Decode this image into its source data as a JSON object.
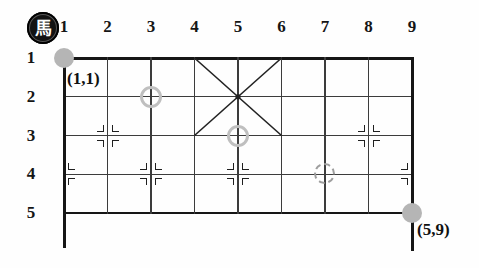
{
  "seal": {
    "char": "馬"
  },
  "board": {
    "columns": [
      "1",
      "2",
      "3",
      "4",
      "5",
      "6",
      "7",
      "8",
      "9"
    ],
    "rows": [
      "1",
      "2",
      "3",
      "4",
      "5"
    ],
    "start_label": "(1,1)",
    "end_label": "(5,9)",
    "markers": [
      {
        "type": "filled-circle",
        "row": 1,
        "col": 1
      },
      {
        "type": "ring-circle",
        "row": 2,
        "col": 3
      },
      {
        "type": "ring-circle",
        "row": 3,
        "col": 5
      },
      {
        "type": "dashed-circle",
        "row": 4,
        "col": 7
      },
      {
        "type": "filled-circle",
        "row": 5,
        "col": 9
      }
    ],
    "point_marks": [
      {
        "row": 3,
        "col": 2,
        "sides": "both"
      },
      {
        "row": 3,
        "col": 8,
        "sides": "both"
      },
      {
        "row": 4,
        "col": 1,
        "sides": "right"
      },
      {
        "row": 4,
        "col": 3,
        "sides": "both"
      },
      {
        "row": 4,
        "col": 5,
        "sides": "both"
      },
      {
        "row": 4,
        "col": 9,
        "sides": "left"
      }
    ],
    "cross": {
      "row_start": 1,
      "col_start": 4,
      "row_end": 3,
      "col_end": 6
    }
  },
  "colors": {
    "background": "#fefefe",
    "border_line": "#161616",
    "inner_line": "#3c3c3c",
    "mark_line": "#1f1f1f",
    "diagonal_line": "#222222",
    "marker_fill": "#b5b5b5",
    "marker_ring": "#bfbfbf",
    "marker_dashed": "#9e9e9e",
    "seal_bg": "#121212",
    "seal_fg": "#ffffff",
    "label_color": "#151515"
  }
}
